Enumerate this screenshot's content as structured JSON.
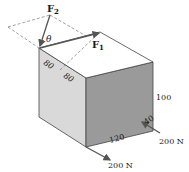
{
  "diagram": {
    "forces": {
      "f1_label": "F",
      "f1_sub": "1",
      "f2_label": "F",
      "f2_sub": "2",
      "theta": "θ",
      "bottom_force": "200 N",
      "right_force": "200 N"
    },
    "dimensions": {
      "top_edge_a": "80",
      "top_edge_b": "80",
      "height": "100",
      "length": "120",
      "depth": "40"
    },
    "colors": {
      "left_face": "#d9d9d9",
      "front_face": "#9a9a9a",
      "top_face": "#ffffff",
      "edge": "#444444",
      "arrow": "#555555"
    }
  }
}
